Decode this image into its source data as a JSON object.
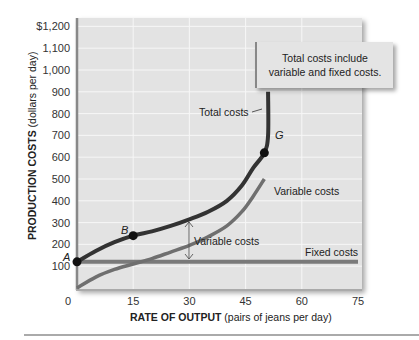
{
  "chart_data": {
    "type": "line",
    "title": "",
    "xlabel_bold": "RATE OF OUTPUT",
    "xlabel_rest": " (pairs of jeans per day)",
    "ylabel_bold": "PRODUCTION COSTS",
    "ylabel_rest": " (dollars per day)",
    "x_ticks": [
      "0",
      "15",
      "30",
      "45",
      "60",
      "75"
    ],
    "y_ticks": [
      "$1,200",
      "1,100",
      "1,000",
      "900",
      "800",
      "700",
      "600",
      "500",
      "400",
      "300",
      "200",
      "100"
    ],
    "xlim": [
      0,
      75
    ],
    "ylim": [
      0,
      1200
    ],
    "grid": true,
    "series": [
      {
        "name": "Total costs",
        "color": "#333333",
        "points": [
          [
            0,
            120
          ],
          [
            5,
            170
          ],
          [
            10,
            210
          ],
          [
            15,
            240
          ],
          [
            20,
            260
          ],
          [
            25,
            285
          ],
          [
            30,
            315
          ],
          [
            35,
            350
          ],
          [
            40,
            400
          ],
          [
            44,
            470
          ],
          [
            47,
            550
          ],
          [
            50,
            620
          ],
          [
            51,
            700
          ],
          [
            51,
            900
          ]
        ]
      },
      {
        "name": "Variable costs",
        "color": "#6e6e6e",
        "points": [
          [
            0,
            0
          ],
          [
            5,
            50
          ],
          [
            10,
            85
          ],
          [
            15,
            110
          ],
          [
            20,
            135
          ],
          [
            25,
            165
          ],
          [
            30,
            195
          ],
          [
            35,
            235
          ],
          [
            40,
            285
          ],
          [
            44,
            350
          ],
          [
            47,
            420
          ],
          [
            50,
            500
          ]
        ]
      },
      {
        "name": "Fixed costs",
        "color": "#777777",
        "points": [
          [
            0,
            120
          ],
          [
            75,
            120
          ]
        ]
      }
    ],
    "points": [
      {
        "label": "A",
        "x": 0,
        "y": 120
      },
      {
        "label": "B",
        "x": 15,
        "y": 240
      },
      {
        "label": "G",
        "x": 50,
        "y": 620
      }
    ],
    "annotations": [
      {
        "text": "Total costs",
        "target": "total-curve"
      },
      {
        "text": "Variable costs",
        "target": "variable-curve"
      },
      {
        "text": "Variable costs",
        "target": "vertical-gap-arrow"
      },
      {
        "text": "Fixed costs",
        "target": "fixed-line"
      }
    ]
  },
  "note": {
    "line1": "Total costs include",
    "line2": "variable and fixed costs."
  },
  "labels": {
    "total_costs": "Total costs",
    "variable_costs_curve": "Variable costs",
    "variable_costs_gap": "Variable costs",
    "fixed_costs": "Fixed costs",
    "point_a": "A",
    "point_b": "B",
    "point_g": "G"
  }
}
